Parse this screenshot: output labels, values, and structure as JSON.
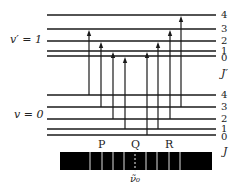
{
  "diagram": {
    "upper_state": {
      "label": "v′ = 1",
      "levels": [
        {
          "J": "4",
          "y": 15
        },
        {
          "J": "3",
          "y": 29
        },
        {
          "J": "2",
          "y": 41
        },
        {
          "J": "1",
          "y": 51
        },
        {
          "J": "0",
          "y": 56
        }
      ],
      "axis_label": "J′"
    },
    "lower_state": {
      "label": "v = 0",
      "levels": [
        {
          "J": "4",
          "y": 95
        },
        {
          "J": "3",
          "y": 107
        },
        {
          "J": "2",
          "y": 119
        },
        {
          "J": "1",
          "y": 129
        },
        {
          "J": "0",
          "y": 135
        }
      ],
      "axis_label": "J"
    },
    "transitions": [
      {
        "branch": "P",
        "from_J": 4,
        "to_J": 3,
        "x": 89
      },
      {
        "branch": "P",
        "from_J": 3,
        "to_J": 2,
        "x": 101
      },
      {
        "branch": "P",
        "from_J": 2,
        "to_J": 1,
        "x": 113
      },
      {
        "branch": "P",
        "from_J": 1,
        "to_J": 0,
        "x": 125
      },
      {
        "branch": "R",
        "from_J": 0,
        "to_J": 1,
        "x": 147
      },
      {
        "branch": "R",
        "from_J": 1,
        "to_J": 2,
        "x": 158
      },
      {
        "branch": "R",
        "from_J": 2,
        "to_J": 3,
        "x": 170
      },
      {
        "branch": "R",
        "from_J": 3,
        "to_J": 4,
        "x": 181
      }
    ],
    "spectrum": {
      "branch_labels": [
        {
          "text": "P",
          "x": 102
        },
        {
          "text": "Q",
          "x": 135
        },
        {
          "text": "R",
          "x": 169
        }
      ],
      "line_x": [
        90,
        102,
        113,
        124,
        146,
        157,
        169,
        180
      ],
      "center_x": 135,
      "center_label": "ν̃₀"
    },
    "colors": {
      "line": "#1a1a1a",
      "background": "#ffffff"
    }
  }
}
